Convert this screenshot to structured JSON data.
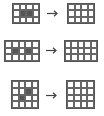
{
  "diagram": {
    "title": "",
    "examples": [
      {
        "input": {
          "rows": 3,
          "cols": 4,
          "filled": [
            [
              1,
              1
            ],
            [
              1,
              2
            ]
          ],
          "x": 12,
          "y": 3,
          "w": 28,
          "h": 21
        },
        "arrow": {
          "x": 47,
          "y": 10,
          "w": 11
        },
        "output": {
          "rows": 3,
          "cols": 4,
          "filled": [],
          "x": 67,
          "y": 3,
          "w": 28,
          "h": 21
        }
      },
      {
        "input": {
          "rows": 3,
          "cols": 5,
          "filled": [
            [
              1,
              1
            ],
            [
              1,
              3
            ]
          ],
          "x": 4,
          "y": 40,
          "w": 36,
          "h": 22
        },
        "arrow": {
          "x": 46,
          "y": 47,
          "w": 11
        },
        "output": {
          "rows": 3,
          "cols": 5,
          "filled": [],
          "x": 64,
          "y": 40,
          "w": 34,
          "h": 22
        }
      },
      {
        "input": {
          "rows": 4,
          "cols": 4,
          "filled": [
            [
              1,
              2
            ],
            [
              2,
              1
            ]
          ],
          "x": 11,
          "y": 80,
          "w": 28,
          "h": 29
        },
        "arrow": {
          "x": 46,
          "y": 92,
          "w": 11
        },
        "output": {
          "rows": 4,
          "cols": 4,
          "filled": [],
          "x": 66,
          "y": 80,
          "w": 29,
          "h": 29
        }
      }
    ],
    "colors": {
      "filled": "#555555",
      "empty": "#ffffff",
      "line": "#666666",
      "arrow": "#444444"
    },
    "icons": {
      "arrow": "right-arrow-icon"
    }
  }
}
